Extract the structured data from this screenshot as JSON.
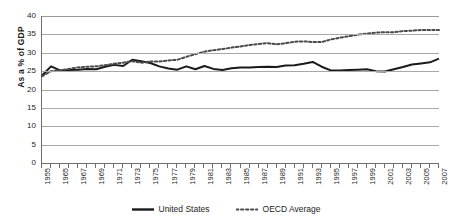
{
  "chart_data": {
    "type": "line",
    "title": "",
    "subtitle": "",
    "xlabel": "",
    "ylabel": "As a % of GDP",
    "ylim": [
      0,
      40
    ],
    "ytick_step": 5,
    "yticks": [
      40,
      35,
      30,
      25,
      20,
      15,
      10,
      5,
      0
    ],
    "grid": true,
    "grid_axis": "y",
    "legend_position": "bottom-center",
    "x": [
      1955,
      1964,
      1965,
      1966,
      1967,
      1968,
      1969,
      1970,
      1971,
      1972,
      1973,
      1974,
      1975,
      1976,
      1977,
      1978,
      1979,
      1980,
      1981,
      1982,
      1983,
      1984,
      1985,
      1986,
      1987,
      1988,
      1989,
      1990,
      1991,
      1992,
      1993,
      1994,
      1995,
      1996,
      1997,
      1998,
      1999,
      2000,
      2001,
      2002,
      2003,
      2004,
      2005,
      2006,
      2007
    ],
    "xtick_labels": [
      "1955",
      "1965",
      "1967",
      "1969",
      "1971",
      "1973",
      "1975",
      "1977",
      "1979",
      "1981",
      "1983",
      "1985",
      "1987",
      "1989",
      "1991",
      "1993",
      "1995",
      "1997",
      "1999",
      "2001",
      "2003",
      "2005",
      "2007"
    ],
    "series": [
      {
        "name": "United States",
        "style": "solid",
        "color": "#1a1a1a",
        "width": 2.0,
        "values": [
          23.8,
          26.3,
          25.2,
          25.3,
          25.4,
          25.6,
          25.5,
          26.2,
          26.7,
          26.4,
          28.1,
          27.7,
          27.2,
          26.3,
          25.7,
          25.4,
          26.3,
          25.5,
          26.4,
          25.6,
          25.3,
          25.8,
          26.0,
          26.0,
          26.1,
          26.2,
          26.1,
          26.5,
          26.6,
          27.0,
          27.5,
          26.2,
          25.2,
          25.2,
          25.3,
          25.4,
          25.5,
          25.0,
          24.9,
          25.5,
          26.1,
          26.8,
          27.1,
          27.4,
          28.4
        ]
      },
      {
        "name": "OECD Average",
        "style": "dotted",
        "color": "#4a4a4a",
        "width": 2.0,
        "values": [
          23.6,
          25.0,
          25.2,
          25.6,
          26.0,
          26.2,
          26.3,
          26.6,
          27.0,
          27.3,
          27.7,
          27.3,
          27.6,
          27.6,
          27.9,
          28.1,
          28.9,
          29.6,
          30.3,
          30.7,
          31.0,
          31.4,
          31.7,
          32.1,
          32.4,
          32.6,
          32.3,
          32.6,
          33.0,
          33.1,
          32.9,
          32.9,
          33.6,
          34.1,
          34.5,
          34.9,
          35.2,
          35.5,
          35.6,
          35.6,
          35.9,
          36.0,
          36.2,
          36.2,
          36.2
        ]
      }
    ]
  },
  "legend": {
    "items": [
      {
        "label": "United States",
        "style": "solid"
      },
      {
        "label": "OECD Average",
        "style": "dotted"
      }
    ]
  }
}
